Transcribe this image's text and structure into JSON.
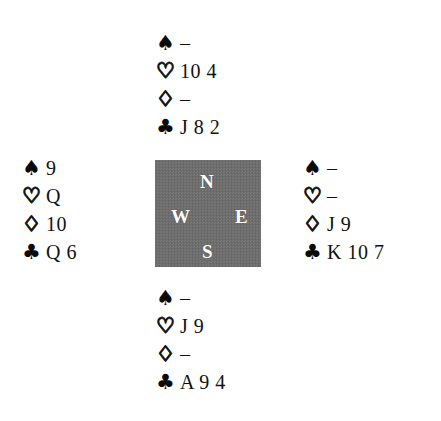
{
  "diagram": {
    "type": "bridge-hand-diagram",
    "background_color": "#ffffff",
    "compass": {
      "box_color": "#6e6e6e",
      "label_color": "#ffffff",
      "north": "N",
      "west": "W",
      "east": "E",
      "south": "S"
    },
    "suit_symbols": {
      "spade": "♠",
      "heart": "♡",
      "diamond": "♢",
      "club": "♣"
    },
    "void_mark": "–",
    "hands": {
      "north": {
        "position_label": "North",
        "suits": [
          {
            "suit": "spade",
            "symbol": "♠",
            "style": "solid",
            "cards": "–"
          },
          {
            "suit": "heart",
            "symbol": "♡",
            "style": "open",
            "cards": "10 4"
          },
          {
            "suit": "diamond",
            "symbol": "♢",
            "style": "open",
            "cards": "–"
          },
          {
            "suit": "club",
            "symbol": "♣",
            "style": "solid",
            "cards": "J 8 2"
          }
        ]
      },
      "west": {
        "position_label": "West",
        "suits": [
          {
            "suit": "spade",
            "symbol": "♠",
            "style": "solid",
            "cards": "9"
          },
          {
            "suit": "heart",
            "symbol": "♡",
            "style": "open",
            "cards": "Q"
          },
          {
            "suit": "diamond",
            "symbol": "♢",
            "style": "open",
            "cards": "10"
          },
          {
            "suit": "club",
            "symbol": "♣",
            "style": "solid",
            "cards": "Q 6"
          }
        ]
      },
      "east": {
        "position_label": "East",
        "suits": [
          {
            "suit": "spade",
            "symbol": "♠",
            "style": "solid",
            "cards": "–"
          },
          {
            "suit": "heart",
            "symbol": "♡",
            "style": "open",
            "cards": "–"
          },
          {
            "suit": "diamond",
            "symbol": "♢",
            "style": "open",
            "cards": "J 9"
          },
          {
            "suit": "club",
            "symbol": "♣",
            "style": "solid",
            "cards": "K 10 7"
          }
        ]
      },
      "south": {
        "position_label": "South",
        "suits": [
          {
            "suit": "spade",
            "symbol": "♠",
            "style": "solid",
            "cards": "–"
          },
          {
            "suit": "heart",
            "symbol": "♡",
            "style": "open",
            "cards": "J 9"
          },
          {
            "suit": "diamond",
            "symbol": "♢",
            "style": "open",
            "cards": "–"
          },
          {
            "suit": "club",
            "symbol": "♣",
            "style": "solid",
            "cards": "A 9 4"
          }
        ]
      }
    }
  }
}
